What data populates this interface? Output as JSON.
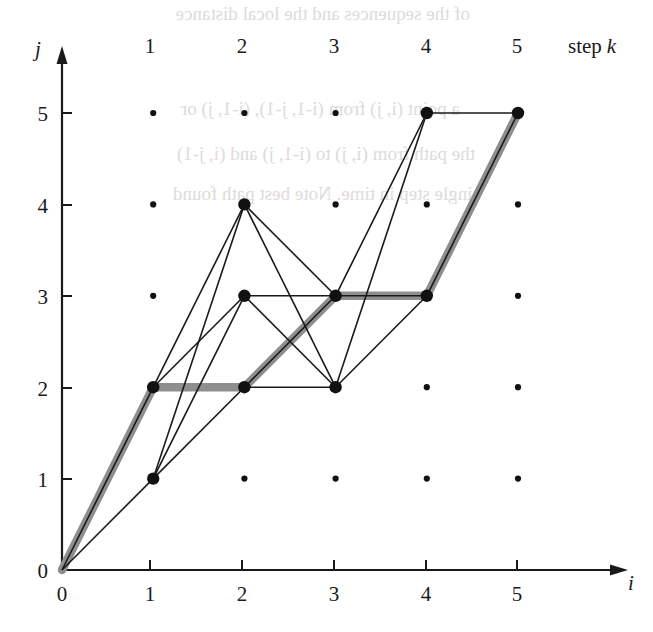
{
  "figure": {
    "kind": "dtw-lattice-diagram",
    "background": "#ffffff",
    "ink_color": "#1a1a1a",
    "path_color": "#8e8e8e",
    "dot_color": "#111111"
  },
  "axes": {
    "x_name": "i",
    "y_name": "j",
    "origin_label": "0",
    "x_ticks": [
      "0",
      "1",
      "2",
      "3",
      "4",
      "5"
    ],
    "y_ticks": [
      "0",
      "1",
      "2",
      "3",
      "4",
      "5"
    ],
    "x_range": [
      0,
      5
    ],
    "y_range": [
      0,
      5
    ]
  },
  "top_axis": {
    "caption": "step k",
    "caption_word": "step",
    "caption_var": "k",
    "labels": [
      "1",
      "2",
      "3",
      "4",
      "5"
    ]
  },
  "chart_data": {
    "type": "scatter",
    "title": "",
    "xlabel": "i",
    "ylabel": "j",
    "xlim": [
      0,
      5
    ],
    "ylim": [
      0,
      5
    ],
    "grid": false,
    "legend": "none",
    "lattice_points": [
      [
        1,
        1
      ],
      [
        1,
        2
      ],
      [
        1,
        3
      ],
      [
        1,
        4
      ],
      [
        1,
        5
      ],
      [
        2,
        1
      ],
      [
        2,
        2
      ],
      [
        2,
        3
      ],
      [
        2,
        4
      ],
      [
        2,
        5
      ],
      [
        3,
        1
      ],
      [
        3,
        2
      ],
      [
        3,
        3
      ],
      [
        3,
        4
      ],
      [
        3,
        5
      ],
      [
        4,
        1
      ],
      [
        4,
        2
      ],
      [
        4,
        3
      ],
      [
        4,
        4
      ],
      [
        4,
        5
      ],
      [
        5,
        1
      ],
      [
        5,
        2
      ],
      [
        5,
        3
      ],
      [
        5,
        4
      ],
      [
        5,
        5
      ]
    ],
    "active_nodes": [
      [
        0,
        0
      ],
      [
        1,
        1
      ],
      [
        1,
        2
      ],
      [
        2,
        2
      ],
      [
        2,
        3
      ],
      [
        2,
        4
      ],
      [
        3,
        2
      ],
      [
        3,
        3
      ],
      [
        4,
        3
      ],
      [
        4,
        5
      ],
      [
        5,
        5
      ]
    ],
    "edges": [
      [
        [
          0,
          0
        ],
        [
          1,
          1
        ]
      ],
      [
        [
          0,
          0
        ],
        [
          1,
          2
        ]
      ],
      [
        [
          1,
          1
        ],
        [
          2,
          2
        ]
      ],
      [
        [
          1,
          1
        ],
        [
          2,
          3
        ]
      ],
      [
        [
          1,
          1
        ],
        [
          2,
          4
        ]
      ],
      [
        [
          1,
          2
        ],
        [
          2,
          3
        ]
      ],
      [
        [
          1,
          2
        ],
        [
          2,
          4
        ]
      ],
      [
        [
          2,
          2
        ],
        [
          3,
          2
        ]
      ],
      [
        [
          2,
          2
        ],
        [
          3,
          3
        ]
      ],
      [
        [
          2,
          3
        ],
        [
          3,
          2
        ]
      ],
      [
        [
          2,
          3
        ],
        [
          3,
          3
        ]
      ],
      [
        [
          2,
          4
        ],
        [
          3,
          2
        ]
      ],
      [
        [
          2,
          4
        ],
        [
          3,
          3
        ]
      ],
      [
        [
          3,
          2
        ],
        [
          4,
          3
        ]
      ],
      [
        [
          3,
          2
        ],
        [
          4,
          5
        ]
      ],
      [
        [
          3,
          3
        ],
        [
          4,
          3
        ]
      ],
      [
        [
          3,
          3
        ],
        [
          4,
          5
        ]
      ],
      [
        [
          4,
          3
        ],
        [
          5,
          5
        ]
      ],
      [
        [
          4,
          5
        ],
        [
          5,
          5
        ]
      ]
    ],
    "optimal_path": [
      [
        0,
        0
      ],
      [
        1,
        2
      ],
      [
        2,
        2
      ],
      [
        3,
        3
      ],
      [
        4,
        3
      ],
      [
        5,
        5
      ]
    ],
    "optimal_path_label": "warping path"
  },
  "bleed_through": {
    "note": "faint show-through text from reverse page",
    "lines": [
      "of the sequences and the local distance",
      "a point (i, j) from (i-1, j-1), (i-1, j) or",
      "the path from (i, j) to (i-1, j) and (i, j-1)",
      "single step in time. Note best path found"
    ]
  }
}
